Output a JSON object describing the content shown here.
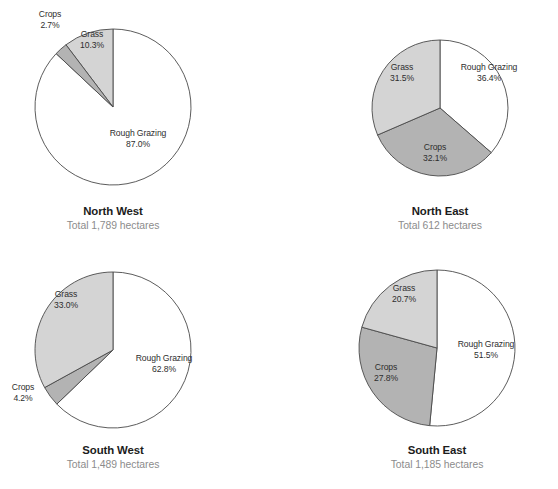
{
  "figure": {
    "background_color": "#ffffff",
    "width": 558,
    "height": 489
  },
  "palette": {
    "rough_grazing": "#ffffff",
    "grass": "#d4d4d4",
    "crops": "#b3b3b3",
    "outline": "#4a4a4a",
    "label_text": "#2e2e2e",
    "region_text": "#1c1c1c",
    "total_text": "#8c8c8c"
  },
  "chart_data": [
    {
      "type": "pie",
      "title": "North West",
      "subtitle": "Total 1,789 hectares",
      "total_hectares": 1789,
      "categories": [
        "Rough Grazing",
        "Grass",
        "Crops"
      ],
      "values": [
        87.0,
        10.3,
        2.7
      ],
      "unit": "%",
      "labels": [
        "Rough Grazing",
        "Grass",
        "Crops"
      ],
      "value_labels": [
        "87.0%",
        "10.3%",
        "2.7%"
      ],
      "colors": [
        "#ffffff",
        "#d4d4d4",
        "#b3b3b3"
      ],
      "legend": "none",
      "start_angle_deg": 0,
      "direction": "counterclockwise-for-grass-crops"
    },
    {
      "type": "pie",
      "title": "North East",
      "subtitle": "Total 612 hectares",
      "total_hectares": 612,
      "categories": [
        "Rough Grazing",
        "Grass",
        "Crops"
      ],
      "values": [
        36.4,
        31.5,
        32.1
      ],
      "unit": "%",
      "labels": [
        "Rough Grazing",
        "Grass",
        "Crops"
      ],
      "value_labels": [
        "36.4%",
        "31.5%",
        "32.1%"
      ],
      "colors": [
        "#ffffff",
        "#d4d4d4",
        "#b3b3b3"
      ],
      "legend": "none",
      "start_angle_deg": 0,
      "direction": "counterclockwise-for-grass-crops"
    },
    {
      "type": "pie",
      "title": "South West",
      "subtitle": "Total 1,489 hectares",
      "total_hectares": 1489,
      "categories": [
        "Rough Grazing",
        "Grass",
        "Crops"
      ],
      "values": [
        62.8,
        33.0,
        4.2
      ],
      "unit": "%",
      "labels": [
        "Rough Grazing",
        "Grass",
        "Crops"
      ],
      "value_labels": [
        "62.8%",
        "33.0%",
        "4.2%"
      ],
      "colors": [
        "#ffffff",
        "#d4d4d4",
        "#b3b3b3"
      ],
      "legend": "none",
      "start_angle_deg": 0,
      "direction": "counterclockwise-for-grass-crops"
    },
    {
      "type": "pie",
      "title": "South East",
      "subtitle": "Total 1,185 hectares",
      "total_hectares": 1185,
      "categories": [
        "Rough Grazing",
        "Grass",
        "Crops"
      ],
      "values": [
        51.5,
        20.7,
        27.8
      ],
      "unit": "%",
      "labels": [
        "Rough Grazing",
        "Grass",
        "Crops"
      ],
      "value_labels": [
        "51.5%",
        "20.7%",
        "27.8%"
      ],
      "colors": [
        "#ffffff",
        "#d4d4d4",
        "#b3b3b3"
      ],
      "legend": "none",
      "start_angle_deg": 0,
      "direction": "counterclockwise-for-grass-crops"
    }
  ],
  "panels": {
    "north_west": {
      "region": "North West",
      "total": "Total 1,789 hectares",
      "slices": {
        "rough_grazing": {
          "name": "Rough Grazing",
          "pct": "87.0%"
        },
        "grass": {
          "name": "Grass",
          "pct": "10.3%"
        },
        "crops": {
          "name": "Crops",
          "pct": "2.7%"
        }
      }
    },
    "north_east": {
      "region": "North East",
      "total": "Total 612 hectares",
      "slices": {
        "rough_grazing": {
          "name": "Rough Grazing",
          "pct": "36.4%"
        },
        "grass": {
          "name": "Grass",
          "pct": "31.5%"
        },
        "crops": {
          "name": "Crops",
          "pct": "32.1%"
        }
      }
    },
    "south_west": {
      "region": "South West",
      "total": "Total 1,489 hectares",
      "slices": {
        "rough_grazing": {
          "name": "Rough Grazing",
          "pct": "62.8%"
        },
        "grass": {
          "name": "Grass",
          "pct": "33.0%"
        },
        "crops": {
          "name": "Crops",
          "pct": "4.2%"
        }
      }
    },
    "south_east": {
      "region": "South East",
      "total": "Total 1,185 hectares",
      "slices": {
        "rough_grazing": {
          "name": "Rough Grazing",
          "pct": "51.5%"
        },
        "grass": {
          "name": "Grass",
          "pct": "20.7%"
        },
        "crops": {
          "name": "Crops",
          "pct": "27.8%"
        }
      }
    }
  }
}
